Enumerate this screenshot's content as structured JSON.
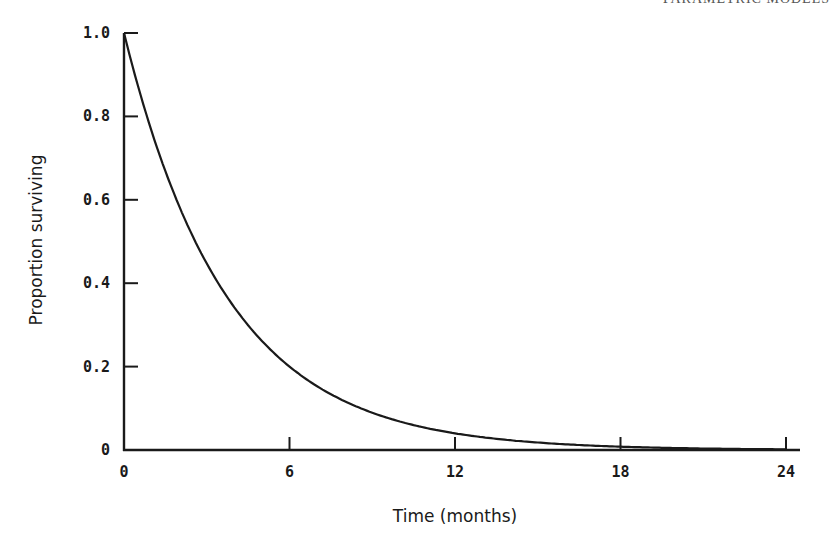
{
  "page_header": "PARAMETRIC MODELS",
  "chart_data": {
    "type": "line",
    "title": "",
    "xlabel": "Time (months)",
    "ylabel": "Proportion surviving",
    "xlim": [
      0,
      24
    ],
    "ylim": [
      0,
      1.0
    ],
    "x_ticks": [
      "0",
      "6",
      "12",
      "18",
      "24"
    ],
    "y_ticks": [
      "0",
      "0.2",
      "0.4",
      "0.6",
      "0.8",
      "1.0"
    ],
    "grid": false,
    "legend": null,
    "series": [
      {
        "name": "Exponential survivor function",
        "x": [
          0,
          1,
          2,
          3,
          4,
          5,
          6,
          7,
          8,
          9,
          10,
          11,
          12,
          13,
          14,
          15,
          16,
          17,
          18,
          19,
          20,
          21,
          22,
          23,
          24
        ],
        "values": [
          1.0,
          0.765,
          0.585,
          0.447,
          0.342,
          0.262,
          0.2,
          0.153,
          0.117,
          0.089,
          0.068,
          0.052,
          0.04,
          0.031,
          0.024,
          0.018,
          0.014,
          0.011,
          0.008,
          0.006,
          0.005,
          0.004,
          0.003,
          0.002,
          0.002
        ]
      }
    ]
  }
}
